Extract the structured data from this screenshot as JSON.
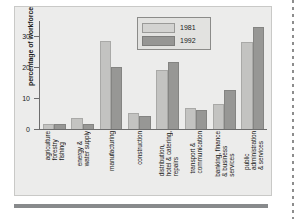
{
  "chart_data": {
    "type": "bar",
    "title": "",
    "xlabel": "",
    "ylabel": "percentage of workforce",
    "ylim": [
      0,
      35
    ],
    "yticks": [
      0,
      10,
      20,
      30
    ],
    "ytick_labels": [
      "0",
      "10",
      "20",
      "30"
    ],
    "grid": false,
    "legend_position": "top-center",
    "categories": [
      "agriculture\nforestry\nfishing",
      "energy &\nwater supply",
      "manufacturing",
      "construction",
      "distribution,\nhotel & catering,\nrepairs",
      "transport &\ncommunication",
      "banking, finance\n& business\nservices",
      "public\nadministration\n& services"
    ],
    "category_lines": [
      [
        "agriculture",
        "forestry",
        "fishing"
      ],
      [
        "energy &",
        "water supply"
      ],
      [
        "manufacturing"
      ],
      [
        "construction"
      ],
      [
        "distribution,",
        "hotel & catering,",
        "repairs"
      ],
      [
        "transport &",
        "communication"
      ],
      [
        "banking, finance",
        "& business",
        "services"
      ],
      [
        "public",
        "administration",
        "& services"
      ]
    ],
    "series": [
      {
        "name": "1981",
        "color": "#c3c3c1",
        "values": [
          1.6,
          3.6,
          28.5,
          5.2,
          19.2,
          6.7,
          8.2,
          28.1
        ]
      },
      {
        "name": "1992",
        "color": "#979795",
        "values": [
          1.5,
          1.7,
          20.2,
          4.2,
          21.6,
          6.2,
          12.7,
          33.0
        ]
      }
    ]
  },
  "legend": {
    "entries": [
      {
        "label": "1981"
      },
      {
        "label": "1992"
      }
    ]
  },
  "axis": {
    "y_title": "percentage of workforce",
    "y_ticks": [
      "30",
      "20",
      "10",
      "0"
    ]
  }
}
